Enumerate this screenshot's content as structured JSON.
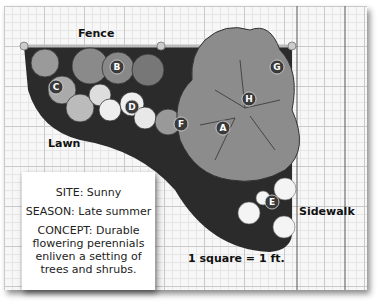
{
  "labels": {
    "fence": "Fence",
    "lawn": "Lawn",
    "sidewalk": "Sidewalk",
    "scale": "1 square = 1 ft."
  },
  "note": {
    "site": "SITE: Sunny",
    "season": "SEASON: Late summer",
    "concept": "CONCEPT: Durable flowering perennials enliven a setting of trees and shrubs."
  },
  "markers": [
    {
      "id": "A",
      "x": 223,
      "y": 128
    },
    {
      "id": "B",
      "x": 117,
      "y": 67
    },
    {
      "id": "C",
      "x": 56,
      "y": 87
    },
    {
      "id": "D",
      "x": 132,
      "y": 107
    },
    {
      "id": "E",
      "x": 272,
      "y": 202
    },
    {
      "id": "F",
      "x": 181,
      "y": 124
    },
    {
      "id": "G",
      "x": 277,
      "y": 67
    },
    {
      "id": "H",
      "x": 249,
      "y": 99
    }
  ]
}
